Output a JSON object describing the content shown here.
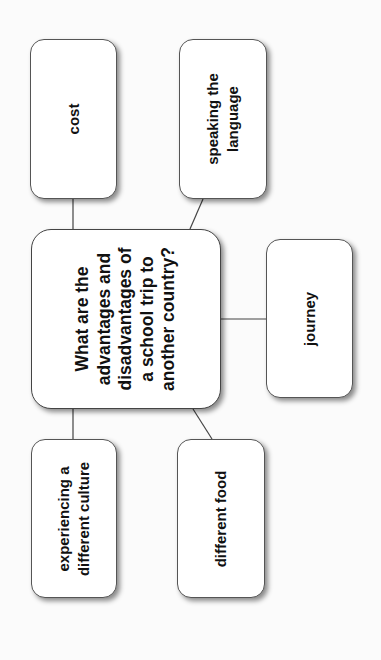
{
  "diagram": {
    "type": "mind-map",
    "orientation": "rotated-90-ccw",
    "central_node": {
      "lines": [
        "What are the",
        "advantages and",
        "disadvantages of",
        "a school trip to",
        "another country?"
      ]
    },
    "nodes": [
      {
        "id": "cost",
        "lines": [
          "cost"
        ]
      },
      {
        "id": "speaking-the-language",
        "lines": [
          "speaking the",
          "language"
        ]
      },
      {
        "id": "journey",
        "lines": [
          "journey"
        ]
      },
      {
        "id": "experiencing-a-different-culture",
        "lines": [
          "experiencing a",
          "different culture"
        ]
      },
      {
        "id": "different-food",
        "lines": [
          "different food"
        ]
      }
    ],
    "colors": {
      "background": "#fbfbfb",
      "box_fill": "#ffffff",
      "border": "#555555",
      "line": "#444444",
      "text": "#111111"
    }
  }
}
